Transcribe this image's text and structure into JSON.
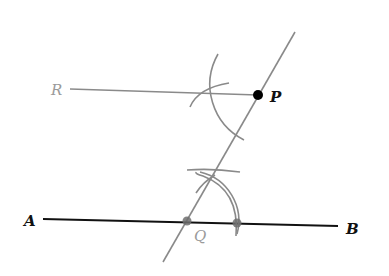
{
  "diagram": {
    "labels": {
      "R": "R",
      "P": "P",
      "A": "A",
      "B": "B",
      "Q": "Q"
    },
    "colors": {
      "black_line": "#111111",
      "gray_line": "#8a8a8a",
      "gray_label": "#9a9a9a",
      "point": "#000000",
      "gray_point": "#6f6f6f"
    },
    "points": {
      "P": [
        258,
        95
      ],
      "Q": [
        187,
        221
      ],
      "Q_arc_on_AB": [
        237,
        223
      ],
      "R_end": [
        70,
        89
      ],
      "A_end": [
        43,
        219
      ],
      "B_end": [
        338,
        226
      ],
      "transversal_top": [
        295,
        32
      ],
      "transversal_bottom": [
        163,
        262
      ]
    }
  }
}
